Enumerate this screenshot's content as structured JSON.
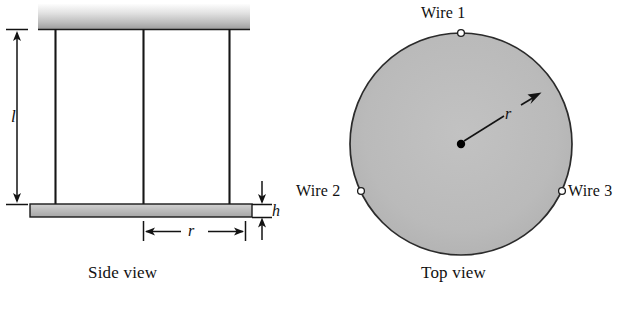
{
  "figure": {
    "views": [
      {
        "id": "side",
        "caption": "Side view"
      },
      {
        "id": "top",
        "caption": "Top view"
      }
    ]
  },
  "side_view": {
    "caption": "Side view",
    "symbols": {
      "length": "l",
      "radius": "r",
      "thickness": "h"
    },
    "ceiling": {
      "name": "support-ceiling",
      "fill_top": "#fbfbfb",
      "fill_bottom": "#a8a8a8"
    },
    "plate": {
      "name": "disk-plate",
      "fill": "#bdbdbd",
      "stroke": "#1a1a1a"
    },
    "wire_count": 3,
    "wire_color": "#161616"
  },
  "top_view": {
    "caption": "Top view",
    "symbols": {
      "radius": "r"
    },
    "disk": {
      "fill": "#b9b9b9",
      "stroke": "#2a2a2a"
    },
    "center_dot_color": "#000000",
    "holes": [
      {
        "label": "Wire 1",
        "angle_deg": 90
      },
      {
        "label": "Wire 2",
        "angle_deg": 205
      },
      {
        "label": "Wire 3",
        "angle_deg": 335
      }
    ]
  },
  "colors": {
    "ink": "#111111",
    "plate_gray": "#bdbdbd",
    "disk_gray": "#b9b9b9"
  }
}
